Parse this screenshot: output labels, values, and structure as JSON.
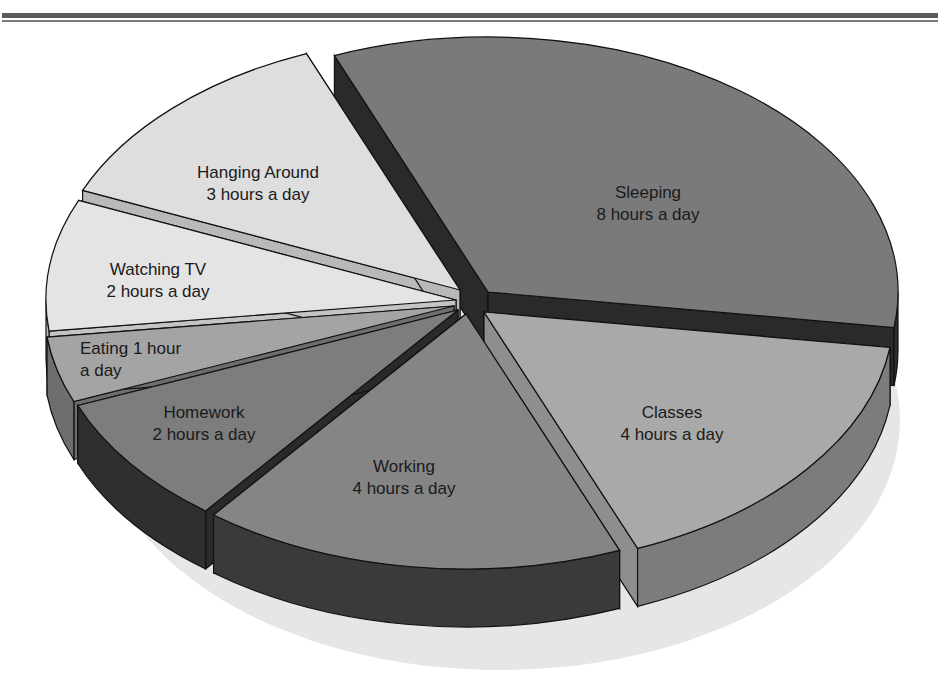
{
  "chart_data": {
    "type": "pie",
    "style": "3d-exploded",
    "title": "",
    "total_hours": 24,
    "categories": [
      "Sleeping",
      "Classes",
      "Working",
      "Homework",
      "Eating",
      "Watching TV",
      "Hanging Around"
    ],
    "values": [
      8,
      4,
      4,
      2,
      1,
      2,
      3
    ],
    "unit": "hours a day",
    "slices": [
      {
        "name": "Sleeping",
        "value": 8,
        "line1": "Sleeping",
        "line2": "8 hours a day",
        "top": "#7a7a7a",
        "side": "#2e2e2e",
        "cut": "#2a2a2a",
        "lx": 648,
        "ly": 198,
        "dx": 18,
        "dy": -8
      },
      {
        "name": "Classes",
        "value": 4,
        "line1": "Classes",
        "line2": "4 hours a day",
        "top": "#a9a9a9",
        "side": "#7c7c7c",
        "cut": "#8e8e8e",
        "lx": 672,
        "ly": 418,
        "dx": 14,
        "dy": 12
      },
      {
        "name": "Working",
        "value": 4,
        "line1": "Working",
        "line2": "4 hours a day",
        "top": "#858585",
        "side": "#3a3a3a",
        "cut": "#303030",
        "lx": 404,
        "ly": 472,
        "dx": -4,
        "dy": 14
      },
      {
        "name": "Homework",
        "value": 2,
        "line1": "Homework",
        "line2": "2 hours a day",
        "top": "#7d7d7d",
        "side": "#2f2f2f",
        "cut": "#2a2a2a",
        "lx": 204,
        "ly": 418,
        "dx": -12,
        "dy": 10
      },
      {
        "name": "Eating",
        "value": 1,
        "line1": "Eating 1 hour",
        "line2": "a day",
        "top": "#a4a4a4",
        "side": "#6e6e6e",
        "cut": "#6e6e6e",
        "lx": 80,
        "ly": 354,
        "dx": -16,
        "dy": 6,
        "anchor": "start"
      },
      {
        "name": "Watching TV",
        "value": 2,
        "line1": "Watching TV",
        "line2": "2 hours a day",
        "top": "#e4e4e4",
        "side": "#bdbdbd",
        "cut": "#c4c4c4",
        "lx": 158,
        "ly": 275,
        "dx": -14,
        "dy": 0
      },
      {
        "name": "Hanging Around",
        "value": 3,
        "line1": "Hanging Around",
        "line2": "3 hours a day",
        "top": "#dedede",
        "side": "#b5b5b5",
        "cut": "#b9b9b9",
        "lx": 258,
        "ly": 178,
        "dx": -10,
        "dy": -10
      }
    ],
    "geometry": {
      "cx": 470,
      "cy": 300,
      "rx": 410,
      "ry": 255,
      "depth": 58,
      "start_angle_deg": -112
    },
    "legend": "none",
    "grid": false
  },
  "page": {
    "top_rules": 2
  }
}
